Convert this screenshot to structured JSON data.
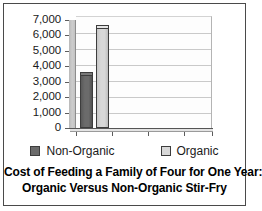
{
  "chart_data": {
    "type": "bar",
    "title": "Cost of Feeding a Family of Four for One Year: Organic Versus Non-Organic Stir-Fry",
    "title_lines": [
      "Cost of Feeding a Family of Four for One Year:",
      "Organic Versus Non-Organic Stir-Fry"
    ],
    "xlabel": "",
    "ylabel": "",
    "categories": [
      "Stir-Fry"
    ],
    "series": [
      {
        "name": "Non-Organic",
        "values": [
          3450
        ],
        "color": "#6b6b6b"
      },
      {
        "name": "Organic",
        "values": [
          6500
        ],
        "color": "#d8d8d8"
      }
    ],
    "ylim": [
      0,
      7000
    ],
    "ytick_values": [
      7000,
      6000,
      5000,
      4000,
      3000,
      2000,
      1000,
      0
    ],
    "ytick_labels": [
      "7,000",
      "6,000",
      "5,000",
      "4,000",
      "3,000",
      "2,000",
      "1,000",
      "0"
    ],
    "xtick_labels": [],
    "grid": true,
    "legend_position": "bottom",
    "legend": [
      {
        "label": "Non-Organic",
        "color": "#6b6b6b"
      },
      {
        "label": "Organic",
        "color": "#d8d8d8"
      }
    ]
  },
  "colors": {
    "frame_border": "#4a4a4a",
    "gridline": "#c9c9c9",
    "axis": "#555555",
    "bar_outline": "#3d3d3d",
    "plot_background": "#fdfdfd",
    "wall": "#c2c2c2",
    "text": "#1a1a1a"
  }
}
